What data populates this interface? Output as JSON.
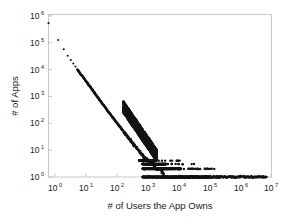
{
  "chart_data": {
    "type": "scatter",
    "title": "",
    "xlabel": "# of Users the App Owns",
    "ylabel": "# of Apps",
    "xscale": "log",
    "yscale": "log",
    "xlim": [
      1,
      10000000
    ],
    "ylim": [
      1,
      1000000
    ],
    "grid": false,
    "legend": null,
    "marker": "point",
    "marker_color": "#141414",
    "marker_size": 1.2,
    "background_color": "#ffffff",
    "frame_color": "#c9c9c9",
    "xticks": [
      1,
      10,
      100,
      1000,
      10000,
      100000,
      1000000,
      10000000
    ],
    "xtick_labels": [
      "10^0",
      "10^1",
      "10^2",
      "10^3",
      "10^4",
      "10^5",
      "10^6",
      "10^7"
    ],
    "xtick_mantissas": [
      "10",
      "10",
      "10",
      "10",
      "10",
      "10",
      "10",
      "10"
    ],
    "xtick_exponents": [
      "0",
      "1",
      "2",
      "3",
      "4",
      "5",
      "6",
      "7"
    ],
    "yticks": [
      1,
      10,
      100,
      1000,
      10000,
      100000,
      1000000
    ],
    "ytick_labels": [
      "10^0",
      "10^1",
      "10^2",
      "10^3",
      "10^4",
      "10^5",
      "10^6"
    ],
    "ytick_mantissas": [
      "10",
      "10",
      "10",
      "10",
      "10",
      "10",
      "10"
    ],
    "ytick_exponents": [
      "0",
      "1",
      "2",
      "3",
      "4",
      "5",
      "6"
    ],
    "points": [
      [
        1,
        480000
      ],
      [
        2,
        115000
      ],
      [
        3,
        52000
      ],
      [
        4,
        30000
      ],
      [
        5,
        21000
      ],
      [
        6,
        15500
      ],
      [
        7,
        12000
      ],
      [
        8,
        9500
      ],
      [
        9,
        7800
      ],
      [
        10,
        6600
      ],
      [
        12,
        5000
      ],
      [
        14,
        3900
      ],
      [
        16,
        3150
      ],
      [
        18,
        2600
      ],
      [
        20,
        2200
      ],
      [
        23,
        1750
      ],
      [
        26,
        1420
      ],
      [
        30,
        1130
      ],
      [
        34,
        920
      ],
      [
        38,
        770
      ],
      [
        43,
        630
      ],
      [
        48,
        530
      ],
      [
        54,
        440
      ],
      [
        60,
        375
      ],
      [
        68,
        305
      ],
      [
        76,
        255
      ],
      [
        85,
        215
      ],
      [
        95,
        180
      ],
      [
        107,
        150
      ],
      [
        120,
        126
      ],
      [
        134,
        107
      ],
      [
        150,
        90
      ],
      [
        168,
        76
      ],
      [
        188,
        64
      ],
      [
        210,
        54
      ],
      [
        236,
        45
      ],
      [
        264,
        38
      ],
      [
        296,
        32
      ],
      [
        331,
        27
      ],
      [
        371,
        23
      ],
      [
        416,
        19
      ],
      [
        466,
        16
      ],
      [
        522,
        14
      ],
      [
        585,
        12
      ],
      [
        655,
        10
      ],
      [
        734,
        9
      ],
      [
        822,
        7
      ],
      [
        921,
        6
      ],
      [
        1032,
        5
      ],
      [
        1156,
        5
      ],
      [
        1295,
        4
      ],
      [
        1451,
        4
      ],
      [
        1626,
        3
      ],
      [
        1821,
        3
      ],
      [
        2040,
        3
      ],
      [
        2286,
        2
      ],
      [
        2560,
        2
      ],
      [
        2868,
        2
      ],
      [
        3213,
        2
      ],
      [
        3600,
        2
      ],
      [
        4033,
        1
      ],
      [
        4518,
        1
      ],
      [
        5061,
        1
      ],
      [
        5670,
        1
      ],
      [
        6352,
        1
      ],
      [
        7117,
        1
      ],
      [
        7973,
        1
      ],
      [
        8932,
        1
      ],
      [
        10005,
        1
      ],
      [
        12000,
        1
      ],
      [
        15000,
        1
      ],
      [
        19000,
        1
      ],
      [
        24000,
        1
      ],
      [
        30000,
        1
      ],
      [
        40000,
        1
      ],
      [
        55000,
        1
      ],
      [
        75000,
        1
      ],
      [
        100000,
        1
      ],
      [
        140000,
        1
      ],
      [
        200000,
        1
      ],
      [
        300000,
        1
      ],
      [
        450000,
        1
      ],
      [
        700000,
        1
      ],
      [
        1100000,
        1
      ],
      [
        1800000,
        1
      ],
      [
        2600000,
        1
      ],
      [
        3600000,
        1
      ],
      [
        5200000,
        1
      ],
      [
        7000000,
        1
      ]
    ],
    "tail_bands": [
      {
        "y": 1,
        "x_start": 900,
        "x_end": 2400000,
        "note": "dense solid band"
      },
      {
        "y": 2,
        "x_start": 900,
        "x_end": 180000,
        "note": "dense band with sparse tail"
      },
      {
        "y": 3,
        "x_start": 880,
        "x_end": 40000,
        "note": "band"
      },
      {
        "y": 4,
        "x_start": 700,
        "x_end": 14000,
        "note": "short band"
      }
    ]
  }
}
